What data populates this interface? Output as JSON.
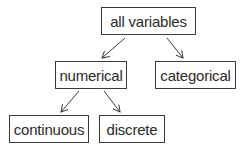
{
  "diagram": {
    "nodes": [
      {
        "id": "all",
        "label": "all variables",
        "x": 101,
        "y": 7,
        "w": 95,
        "h": 28
      },
      {
        "id": "numerical",
        "label": "numerical",
        "x": 55,
        "y": 61,
        "w": 72,
        "h": 28
      },
      {
        "id": "categorical",
        "label": "categorical",
        "x": 155,
        "y": 61,
        "w": 81,
        "h": 28
      },
      {
        "id": "continuous",
        "label": "continuous",
        "x": 9,
        "y": 115,
        "w": 80,
        "h": 28
      },
      {
        "id": "discrete",
        "label": "discrete",
        "x": 99,
        "y": 115,
        "w": 66,
        "h": 28
      }
    ],
    "edges": [
      {
        "from": "all",
        "to": "numerical"
      },
      {
        "from": "all",
        "to": "categorical"
      },
      {
        "from": "numerical",
        "to": "continuous"
      },
      {
        "from": "numerical",
        "to": "discrete"
      }
    ]
  }
}
